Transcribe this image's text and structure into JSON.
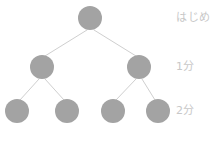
{
  "figure": {
    "type": "binary-tree-diagram",
    "background_color": "#ffffff",
    "width": 220,
    "height": 146
  },
  "style": {
    "node_fill": "#a3a3a3",
    "edge_color": "#cfcfcf",
    "label_color": "#c8c8c8",
    "node_radius": 12,
    "edge_width": 1
  },
  "tier_labels": [
    {
      "id": "tier-0",
      "text": "はじめ",
      "x": 176,
      "y": 12
    },
    {
      "id": "tier-1",
      "text": "1分",
      "x": 176,
      "y": 61
    },
    {
      "id": "tier-2",
      "text": "2分",
      "x": 176,
      "y": 105
    }
  ],
  "nodes": [
    {
      "id": "node-root",
      "level": 0,
      "cx": 90,
      "cy": 18,
      "r": 12
    },
    {
      "id": "node-l",
      "level": 1,
      "cx": 42,
      "cy": 67,
      "r": 12
    },
    {
      "id": "node-r",
      "level": 1,
      "cx": 139,
      "cy": 67,
      "r": 12
    },
    {
      "id": "node-ll",
      "level": 2,
      "cx": 17,
      "cy": 111,
      "r": 12
    },
    {
      "id": "node-lr",
      "level": 2,
      "cx": 67,
      "cy": 111,
      "r": 12
    },
    {
      "id": "node-rl",
      "level": 2,
      "cx": 113,
      "cy": 111,
      "r": 12
    },
    {
      "id": "node-rr",
      "level": 2,
      "cx": 158,
      "cy": 111,
      "r": 12
    }
  ],
  "edges": [
    {
      "id": "edge-root-l",
      "x1": 87,
      "y1": 30,
      "x2": 45,
      "y2": 56
    },
    {
      "id": "edge-root-r",
      "x1": 94,
      "y1": 30,
      "x2": 136,
      "y2": 56
    },
    {
      "id": "edge-l-ll",
      "x1": 39,
      "y1": 79,
      "x2": 20,
      "y2": 100
    },
    {
      "id": "edge-l-lr",
      "x1": 45,
      "y1": 79,
      "x2": 64,
      "y2": 100
    },
    {
      "id": "edge-r-rl",
      "x1": 136,
      "y1": 79,
      "x2": 116,
      "y2": 100
    },
    {
      "id": "edge-r-rr",
      "x1": 142,
      "y1": 79,
      "x2": 155,
      "y2": 100
    }
  ]
}
